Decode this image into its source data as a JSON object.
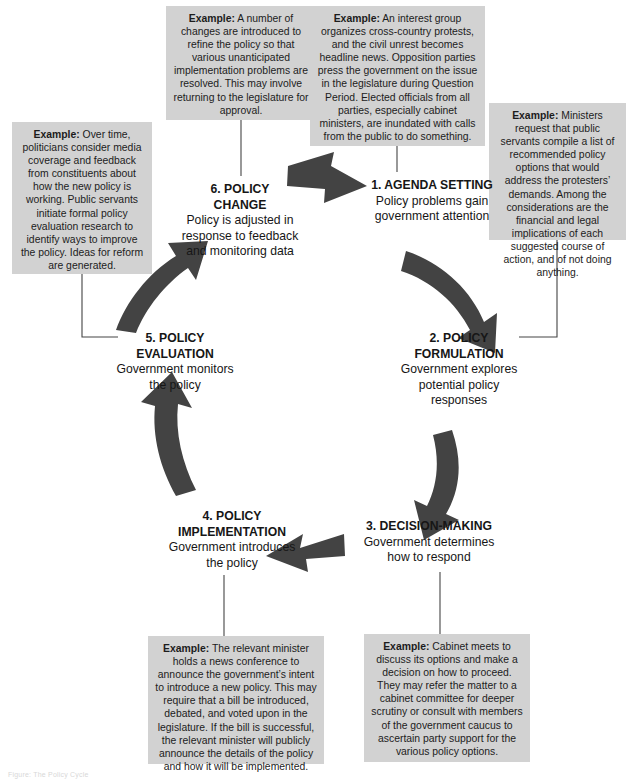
{
  "diagram": {
    "title": "The Policy Cycle",
    "type": "cycle-diagram",
    "accent_color": "#404040",
    "callout_bg": "#d2d2d2",
    "text_color": "#1a1a1a",
    "bottom_caption": "Figure: The Policy Cycle"
  },
  "stages": [
    {
      "number": "1.",
      "title": "1. AGENDA SETTING",
      "description": "Policy problems gain government attention"
    },
    {
      "number": "2.",
      "title": "2. POLICY FORMULATION",
      "title_line1": "2. POLICY",
      "title_line2": "FORMULATION",
      "description": "Government explores potential policy responses"
    },
    {
      "number": "3.",
      "title": "3. DECISION-MAKING",
      "description": "Government determines how to respond"
    },
    {
      "number": "4.",
      "title": "4. POLICY IMPLEMENTATION",
      "title_line1": "4. POLICY",
      "title_line2": "IMPLEMENTATION",
      "description": "Government introduces the policy"
    },
    {
      "number": "5.",
      "title": "5. POLICY EVALUATION",
      "title_line1": "5. POLICY",
      "title_line2": "EVALUATION",
      "description": "Government monitors the policy"
    },
    {
      "number": "6.",
      "title": "6. POLICY CHANGE",
      "title_line1": "6. POLICY",
      "title_line2": "CHANGE",
      "description": "Policy is adjusted in response to feedback and monitoring data"
    }
  ],
  "examples": {
    "agenda_setting": {
      "label": "Example:",
      "text": " An interest group organizes cross-country protests, and the civil unrest becomes headline news. Opposition parties press the government on the issue in the legislature during Question Period. Elected officials from all parties, especially cabinet ministers, are inundated with calls from the public to do something."
    },
    "policy_formulation": {
      "label": "Example:",
      "text": " Ministers request that public servants compile a list of recommended policy options that would address the protesters’ demands. Among the considerations are the financial and legal implications of each suggested course of action, and of not doing anything."
    },
    "decision_making": {
      "label": "Example:",
      "text": " Cabinet meets to discuss its options and make a decision on how to proceed. They may refer the matter to a cabinet committee for deeper scrutiny or consult with members of the government caucus to ascertain party support for the various policy options."
    },
    "policy_implementation": {
      "label": "Example:",
      "text": " The relevant minister holds a news conference to announce the government’s intent to introduce a new policy. This may require that a bill be introduced, debated, and voted upon in the legislature. If the bill is successful, the relevant minister will publicly announce the details of the policy and how it will be implemented."
    },
    "policy_evaluation": {
      "label": "Example:",
      "text": " Over time, politicians consider media coverage and feedback from constituents about how the new policy is working. Public servants initiate formal policy evaluation research to identify ways to improve the policy. Ideas for reform are generated."
    },
    "policy_change": {
      "label": "Example:",
      "text": " A number of changes are introduced to refine the policy so that various unanticipated implementation problems are resolved. This may involve returning to the legislature for approval."
    }
  }
}
